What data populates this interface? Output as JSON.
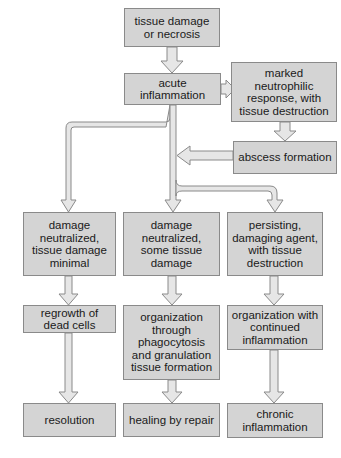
{
  "diagram": {
    "type": "flowchart",
    "nodes": {
      "start": "tissue damage\nor necrosis",
      "acute": "acute inflammation",
      "neutrophilic": "marked\nneutrophilic\nresponse, with\ntissue destruction",
      "abscess": "abscess formation",
      "minimal": "damage\nneutralized,\ntissue damage\nminimal",
      "some_damage": "damage\nneutralized,\nsome tissue\ndamage",
      "persisting": "persisting,\ndamaging agent,\nwith tissue\ndestruction",
      "regrowth": "regrowth of\ndead cells",
      "organization": "organization\nthrough\nphagocytosis\nand granulation\ntissue formation",
      "organization_continued": "organization with\ncontinued\ninflammation",
      "resolution": "resolution",
      "healing": "healing by repair",
      "chronic": "chronic\ninflammation"
    },
    "edges": [
      [
        "tissue damage or necrosis",
        "acute inflammation"
      ],
      [
        "acute inflammation",
        "marked neutrophilic response, with tissue destruction"
      ],
      [
        "marked neutrophilic response, with tissue destruction",
        "abscess formation"
      ],
      [
        "abscess formation",
        "acute inflammation trunk"
      ],
      [
        "acute inflammation",
        "damage neutralized, tissue damage minimal"
      ],
      [
        "acute inflammation",
        "damage neutralized, some tissue damage"
      ],
      [
        "acute inflammation",
        "persisting, damaging agent, with tissue destruction"
      ],
      [
        "damage neutralized, tissue damage minimal",
        "regrowth of dead cells"
      ],
      [
        "damage neutralized, some tissue damage",
        "organization through phagocytosis and granulation tissue formation"
      ],
      [
        "persisting, damaging agent, with tissue destruction",
        "organization with continued inflammation"
      ],
      [
        "regrowth of dead cells",
        "resolution"
      ],
      [
        "organization through phagocytosis and granulation tissue formation",
        "healing by repair"
      ],
      [
        "organization with continued inflammation",
        "chronic inflammation"
      ]
    ],
    "colors": {
      "box_fill": "#d4d4d4",
      "box_border": "#8a8a8a",
      "arrow_fill": "#e6e6e6",
      "arrow_stroke": "#8a8a8a"
    }
  }
}
